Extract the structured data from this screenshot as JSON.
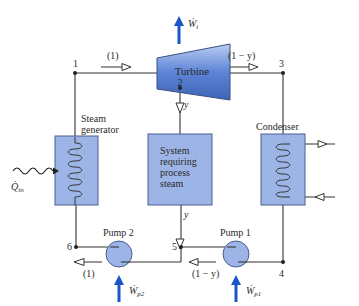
{
  "colors": {
    "component_fill": "#9db4e6",
    "component_stroke": "#4a5f8f",
    "turbine_fill": "#5d84d6",
    "work_arrow": "#1b55c8",
    "line": "#333333"
  },
  "states": {
    "s1": "1",
    "s2": "2",
    "s3": "3",
    "s4": "4",
    "s5": "5",
    "s6": "6"
  },
  "components": {
    "turbine": "Turbine",
    "steam_generator_line1": "Steam",
    "steam_generator_line2": "generator",
    "process_line1": "System",
    "process_line2": "requiring",
    "process_line3": "process",
    "process_line4": "steam",
    "condenser": "Condenser",
    "pump1": "Pump 1",
    "pump2": "Pump 2"
  },
  "flows": {
    "top_left": "(1)",
    "top_right": "(1 − y)",
    "turbine_extraction": "y",
    "process_exit": "y",
    "bottom_left": "(1)",
    "bottom_right": "(1 − y)"
  },
  "energy": {
    "turbine_work": "Ẇ",
    "turbine_work_sub": "t",
    "heat_in": "Q̇",
    "heat_in_sub": "in",
    "pump1_work": "Ẇ",
    "pump1_work_sub": "p1",
    "pump2_work": "Ẇ",
    "pump2_work_sub": "p2"
  }
}
